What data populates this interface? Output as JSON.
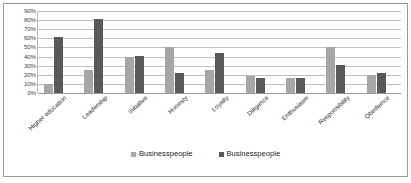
{
  "chart_data": {
    "type": "bar",
    "title": "",
    "xlabel": "",
    "ylabel": "",
    "ylim": [
      0,
      90
    ],
    "ytick_labels": [
      "90%",
      "80%",
      "70%",
      "60%",
      "50%",
      "40%",
      "30%",
      "20%",
      "10%",
      "0%"
    ],
    "ytick_values": [
      90,
      80,
      70,
      60,
      50,
      40,
      30,
      20,
      10,
      0
    ],
    "grid": true,
    "legend_position": "bottom",
    "categories": [
      "Higher education",
      "Leadership",
      "Initiative",
      "Honesty",
      "Loyalty",
      "Diligence",
      "Enthusiasm",
      "Responsibility",
      "Obedience"
    ],
    "series": [
      {
        "name": "Businesspeople",
        "color": "#a6a6a6",
        "values": [
          10,
          25,
          40,
          50,
          25,
          19,
          16,
          51,
          20
        ]
      },
      {
        "name": "Businesspeople",
        "color": "#595959",
        "values": [
          62,
          81,
          41,
          22,
          44,
          16,
          16,
          31,
          22
        ]
      }
    ]
  },
  "legend": {
    "items": [
      {
        "label": "Businesspeople",
        "color": "#a6a6a6"
      },
      {
        "label": "Businesspeople",
        "color": "#595959"
      }
    ]
  },
  "colors": {
    "series_light": "#a6a6a6",
    "series_dark": "#595959",
    "gridline": "#bfbfbf",
    "border": "#9a9a9a",
    "text": "#2f2f2f"
  }
}
